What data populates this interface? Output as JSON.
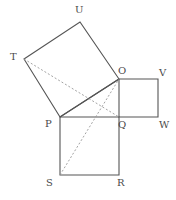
{
  "figure": {
    "canvas": {
      "width": 176,
      "height": 200,
      "background": "#ffffff"
    },
    "style": {
      "solid_stroke": "#555555",
      "dashed_stroke": "#999999",
      "label_color": "#4a4a4a",
      "solid_width": 1.1,
      "dashed_width": 0.9,
      "dash_pattern": "2,2"
    },
    "points": {
      "T": {
        "x": 24,
        "y": 59,
        "label": "T",
        "label_x": 10,
        "label_y": 52
      },
      "U": {
        "x": 80,
        "y": 22,
        "label": "U",
        "label_x": 75,
        "label_y": 5
      },
      "O": {
        "x": 119,
        "y": 79,
        "label": "O",
        "label_x": 118,
        "label_y": 66
      },
      "V": {
        "x": 158,
        "y": 79,
        "label": "V",
        "label_x": 159,
        "label_y": 68
      },
      "P": {
        "x": 60,
        "y": 117,
        "label": "P",
        "label_x": 45,
        "label_y": 119
      },
      "Q": {
        "x": 119,
        "y": 117,
        "label": "Q",
        "label_x": 118,
        "label_y": 120
      },
      "W": {
        "x": 158,
        "y": 117,
        "label": "W",
        "label_x": 159,
        "label_y": 120
      },
      "S": {
        "x": 60,
        "y": 175,
        "label": "S",
        "label_x": 46,
        "label_y": 178
      },
      "R": {
        "x": 119,
        "y": 175,
        "label": "R",
        "label_x": 117,
        "label_y": 178
      }
    },
    "shapes": [
      {
        "name": "square-tilted-TUOP",
        "kind": "square",
        "vertices": [
          "T",
          "U",
          "O",
          "P"
        ],
        "style": "solid",
        "path": "M24,59 L80,22 L119,79 L60,117 Z"
      },
      {
        "name": "square-small-OVWQ",
        "kind": "square",
        "vertices": [
          "O",
          "V",
          "W",
          "Q"
        ],
        "style": "solid",
        "path": "M119,79 L158,79 L158,117 L119,117 Z"
      },
      {
        "name": "square-large-PQRS",
        "kind": "square",
        "vertices": [
          "P",
          "Q",
          "R",
          "S"
        ],
        "style": "solid",
        "path": "M60,117 L119,117 L119,175 L60,175 Z"
      }
    ],
    "segments": [
      {
        "name": "diagonal-P-O",
        "from": "P",
        "to": "O",
        "style": "solid",
        "x1": 60,
        "y1": 117,
        "x2": 119,
        "y2": 79
      },
      {
        "name": "dashed-T-Q",
        "from": "T",
        "to": "Q",
        "style": "dashed",
        "x1": 24,
        "y1": 59,
        "x2": 119,
        "y2": 117
      },
      {
        "name": "dashed-S-O",
        "from": "S",
        "to": "O",
        "style": "dashed",
        "x1": 60,
        "y1": 175,
        "x2": 119,
        "y2": 79
      }
    ]
  }
}
